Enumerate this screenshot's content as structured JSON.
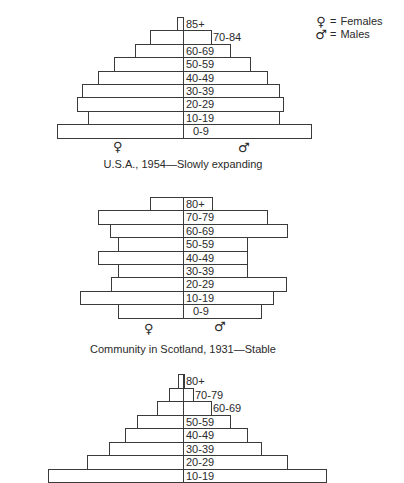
{
  "legend": {
    "female": {
      "symbol": "♀",
      "eq": "=",
      "label": "Females"
    },
    "male": {
      "symbol": "♂",
      "eq": "=",
      "label": "Males"
    }
  },
  "chart_data": [
    {
      "type": "population-pyramid",
      "title": "U.S.A., 1954—Slowly expanding",
      "center_x": 183,
      "top_y": 17,
      "row_height": 13.4,
      "female_symbol": {
        "text": "♀",
        "x": 113,
        "y": 140
      },
      "male_symbol": {
        "text": "♂",
        "x": 238,
        "y": 141
      },
      "caption_y": 158,
      "rows": [
        {
          "age": "85+",
          "left": 177,
          "right": 183,
          "label_x": 186
        },
        {
          "age": "70-84",
          "left": 150,
          "right": 211,
          "label_x": 213
        },
        {
          "age": "60-69",
          "left": 135,
          "right": 230,
          "label_x": 186
        },
        {
          "age": "50-59",
          "left": 114,
          "right": 250,
          "label_x": 186
        },
        {
          "age": "40-49",
          "left": 98,
          "right": 267,
          "label_x": 186
        },
        {
          "age": "30-39",
          "left": 82,
          "right": 279,
          "label_x": 186
        },
        {
          "age": "20-29",
          "left": 77,
          "right": 283,
          "label_x": 186
        },
        {
          "age": "10-19",
          "left": 88,
          "right": 279,
          "label_x": 186
        },
        {
          "age": "0-9",
          "left": 57,
          "right": 311,
          "label_x": 193
        }
      ]
    },
    {
      "type": "population-pyramid",
      "title": "Community in Scotland, 1931—Stable",
      "center_x": 183,
      "top_y": 197,
      "row_height": 13.4,
      "female_symbol": {
        "text": "♀",
        "x": 144,
        "y": 322
      },
      "male_symbol": {
        "text": "♂",
        "x": 214,
        "y": 320
      },
      "caption_y": 343,
      "rows": [
        {
          "age": "80+",
          "left": 150,
          "right": 212,
          "label_x": 186
        },
        {
          "age": "70-79",
          "left": 98,
          "right": 267,
          "label_x": 186
        },
        {
          "age": "60-69",
          "left": 110,
          "right": 287,
          "label_x": 186
        },
        {
          "age": "50-59",
          "left": 118,
          "right": 247,
          "label_x": 186
        },
        {
          "age": "40-49",
          "left": 98,
          "right": 247,
          "label_x": 186
        },
        {
          "age": "30-39",
          "left": 118,
          "right": 247,
          "label_x": 186
        },
        {
          "age": "20-29",
          "left": 111,
          "right": 286,
          "label_x": 186
        },
        {
          "age": "10-19",
          "left": 80,
          "right": 273,
          "label_x": 186
        },
        {
          "age": "0-9",
          "left": 118,
          "right": 261,
          "label_x": 193
        }
      ]
    },
    {
      "type": "population-pyramid",
      "title": "",
      "center_x": 183,
      "top_y": 374,
      "row_height": 13.5,
      "rows": [
        {
          "age": "80+",
          "left": 178,
          "right": 184,
          "label_x": 186
        },
        {
          "age": "70-79",
          "left": 169,
          "right": 193,
          "label_x": 195
        },
        {
          "age": "60-69",
          "left": 157,
          "right": 211,
          "label_x": 213
        },
        {
          "age": "50-59",
          "left": 137,
          "right": 230,
          "label_x": 186
        },
        {
          "age": "40-49",
          "left": 125,
          "right": 247,
          "label_x": 186
        },
        {
          "age": "30-39",
          "left": 109,
          "right": 261,
          "label_x": 186
        },
        {
          "age": "20-29",
          "left": 87,
          "right": 287,
          "label_x": 186
        },
        {
          "age": "10-19",
          "left": 48,
          "right": 326,
          "label_x": 186
        }
      ]
    }
  ]
}
